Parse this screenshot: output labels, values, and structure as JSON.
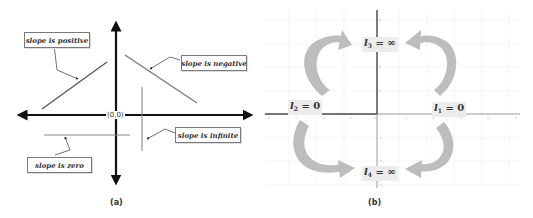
{
  "panel_a": {
    "caption": "(a)",
    "origin_label": "(0,0)",
    "callouts": [
      {
        "id": "positive",
        "text": "slope is positive"
      },
      {
        "id": "negative",
        "text": "slope is negative"
      },
      {
        "id": "infinite",
        "text": "slope is infinite"
      },
      {
        "id": "zero",
        "text": "slope is zero"
      }
    ]
  },
  "panel_b": {
    "caption": "(b)",
    "labels": [
      {
        "id": "l3",
        "var": "l",
        "sub": "3",
        "rest": " = ∞"
      },
      {
        "id": "l2",
        "var": "l",
        "sub": "2",
        "rest": " = 0"
      },
      {
        "id": "l1",
        "var": "l",
        "sub": "1",
        "rest": " = 0"
      },
      {
        "id": "l4",
        "var": "l",
        "sub": "4",
        "rest": " = ∞"
      }
    ],
    "x_ticks": [
      "-4",
      "-3",
      "-2",
      "-1",
      "0",
      "1",
      "2",
      "3",
      "4",
      "5"
    ],
    "y_ticks": [
      "4",
      "3",
      "2",
      "1",
      "-1",
      "-2",
      "-3",
      "-4",
      "-5"
    ],
    "colors": {
      "arrow": "#bdbdbd",
      "axis_dark": "#444444",
      "axis_light": "#9a9a9a",
      "grid": "#eeeeee"
    }
  }
}
